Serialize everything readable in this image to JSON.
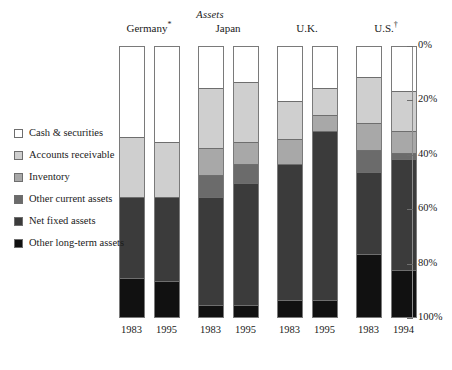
{
  "chart_data": {
    "type": "bar",
    "subtype": "stacked-percent-column",
    "title": "Assets",
    "xlabel": "",
    "ylabel": "",
    "ylim": [
      0,
      100
    ],
    "y_axis_inverted": true,
    "grid": false,
    "legend_position": "left",
    "y_ticks": [
      {
        "value": 0,
        "label": "0%"
      },
      {
        "value": 20,
        "label": "20%"
      },
      {
        "value": 40,
        "label": "40%"
      },
      {
        "value": 60,
        "label": "60%"
      },
      {
        "value": 80,
        "label": "80%"
      },
      {
        "value": 100,
        "label": "100%"
      }
    ],
    "groups": [
      {
        "label": "Germany",
        "marker": "*"
      },
      {
        "label": "Japan",
        "marker": ""
      },
      {
        "label": "U.K.",
        "marker": ""
      },
      {
        "label": "U.S.",
        "marker": "†"
      }
    ],
    "categories": [
      "1983",
      "1995",
      "1983",
      "1995",
      "1983",
      "1995",
      "1983",
      "1994"
    ],
    "series": [
      {
        "name": "Cash & securities",
        "color": "#ffffff",
        "values": [
          33,
          35,
          15,
          13,
          20,
          15,
          11,
          16
        ]
      },
      {
        "name": "Accounts receivable",
        "color": "#cfcfcf",
        "values": [
          22,
          20,
          22,
          22,
          14,
          10,
          17,
          15
        ]
      },
      {
        "name": "Inventory",
        "color": "#a8a8a8",
        "values": [
          0,
          0,
          10,
          8,
          9,
          6,
          10,
          8
        ]
      },
      {
        "name": "Other current assets",
        "color": "#6b6b6b",
        "values": [
          0,
          0,
          8,
          7,
          0,
          0,
          8,
          2
        ]
      },
      {
        "name": "Net fixed assets",
        "color": "#3b3b3b",
        "values": [
          30,
          31,
          40,
          45,
          50,
          62,
          30,
          41
        ]
      },
      {
        "name": "Other long-term assets",
        "color": "#111111",
        "values": [
          15,
          14,
          5,
          5,
          7,
          7,
          24,
          18
        ]
      }
    ]
  },
  "legend": {
    "items": [
      {
        "label": "Cash & securities",
        "color": "#ffffff"
      },
      {
        "label": "Accounts receivable",
        "color": "#cfcfcf"
      },
      {
        "label": "Inventory",
        "color": "#a8a8a8"
      },
      {
        "label": "Other current assets",
        "color": "#6b6b6b"
      },
      {
        "label": "Net fixed assets",
        "color": "#3b3b3b"
      },
      {
        "label": "Other long-term assets",
        "color": "#111111"
      }
    ]
  }
}
